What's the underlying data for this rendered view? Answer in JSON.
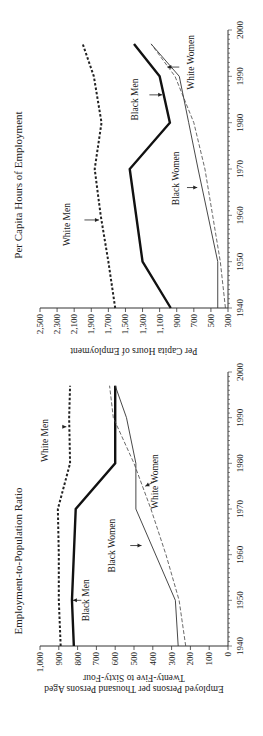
{
  "chart_data": [
    {
      "type": "line",
      "title": "Per Capita Hours of Employment",
      "xlabel": "",
      "ylabel": "Per Capita Hours of Employment",
      "x": [
        1940,
        1950,
        1970,
        1980,
        1990,
        1997
      ],
      "xticks": [
        "1940",
        "1950",
        "1960",
        "1970",
        "1980",
        "1990",
        "2000"
      ],
      "yticks": [
        "300",
        "500",
        "700",
        "900",
        "1,100",
        "1,300",
        "1,500",
        "1,700",
        "1,900",
        "2,100",
        "2,300",
        "2,500"
      ],
      "ylim": [
        300,
        2500
      ],
      "xlim": [
        1940,
        2000
      ],
      "grid": false,
      "series": [
        {
          "name": "White Men",
          "style": "dotted-thick",
          "x": [
            1940,
            1950,
            1960,
            1970,
            1980,
            1990,
            1997
          ],
          "values": [
            1620,
            1700,
            1790,
            1860,
            1780,
            1870,
            2000
          ]
        },
        {
          "name": "Black Men",
          "style": "solid-thick",
          "x": [
            1940,
            1950,
            1970,
            1980,
            1990,
            1997
          ],
          "values": [
            970,
            1300,
            1450,
            980,
            1100,
            1400
          ]
        },
        {
          "name": "Black Women",
          "style": "solid-thin",
          "x": [
            1940,
            1950,
            1970,
            1980,
            1990,
            1997
          ],
          "values": [
            420,
            420,
            650,
            760,
            870,
            1200
          ]
        },
        {
          "name": "White Women",
          "style": "dashed-thin",
          "x": [
            1940,
            1950,
            1960,
            1970,
            1980,
            1990,
            1997
          ],
          "values": [
            330,
            390,
            480,
            570,
            700,
            920,
            1200
          ]
        }
      ],
      "annotations": [
        "White Men",
        "Black Men",
        "Black Women",
        "White Women"
      ]
    },
    {
      "type": "line",
      "title": "Employment-to-Population Ratio",
      "xlabel": "",
      "ylabel": "Employed Persons per Thousand Persons Aged Twenty-Five to Sixty-Four",
      "x": [
        1940,
        1950,
        1970,
        1980,
        1990,
        1997
      ],
      "xticks": [
        "1940",
        "1950",
        "1960",
        "1970",
        "1980",
        "1990",
        "2000"
      ],
      "yticks": [
        "0",
        "100",
        "200",
        "300",
        "400",
        "500",
        "600",
        "700",
        "800",
        "900",
        "1,000"
      ],
      "ylim": [
        0,
        1000
      ],
      "xlim": [
        1940,
        2000
      ],
      "grid": false,
      "series": [
        {
          "name": "White Men",
          "style": "dotted-thick",
          "x": [
            1940,
            1950,
            1960,
            1970,
            1980,
            1990,
            1997
          ],
          "values": [
            890,
            900,
            900,
            905,
            840,
            845,
            840
          ]
        },
        {
          "name": "Black Men",
          "style": "solid-thick",
          "x": [
            1940,
            1950,
            1970,
            1980,
            1990,
            1997
          ],
          "values": [
            820,
            830,
            810,
            600,
            600,
            600
          ]
        },
        {
          "name": "Black Women",
          "style": "solid-thin",
          "x": [
            1940,
            1950,
            1970,
            1980,
            1990,
            1997
          ],
          "values": [
            265,
            280,
            490,
            490,
            540,
            600
          ]
        },
        {
          "name": "White Women",
          "style": "dashed-thin",
          "x": [
            1940,
            1950,
            1960,
            1970,
            1980,
            1990,
            1997
          ],
          "values": [
            225,
            260,
            330,
            410,
            500,
            610,
            630
          ]
        }
      ],
      "annotations": [
        "White Men",
        "Black Men",
        "Black Women",
        "White Women"
      ]
    }
  ],
  "top_chart": {
    "title": "Per Capita Hours of Employment",
    "ylabel": "Per Capita Hours of Employment",
    "labels": {
      "white_men": "White Men",
      "black_men": "Black Men",
      "black_women": "Black Women",
      "white_women": "White Women"
    }
  },
  "bottom_chart": {
    "title": "Employment-to-Population Ratio",
    "ylabel_line1": "Employed Persons per Thousand Persons Aged",
    "ylabel_line2": "Twenty-Five to Sixty-Four",
    "labels": {
      "white_men": "White Men",
      "black_men": "Black Men",
      "black_women": "Black Women",
      "white_women": "White Women"
    }
  }
}
